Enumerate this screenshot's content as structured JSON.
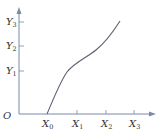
{
  "figure": {
    "origin_label": "O",
    "x_axis": {
      "ticks": [
        {
          "label": "X",
          "sub": "0"
        },
        {
          "label": "X",
          "sub": "1"
        },
        {
          "label": "X",
          "sub": "2"
        },
        {
          "label": "X",
          "sub": "3"
        }
      ]
    },
    "y_axis": {
      "ticks": [
        {
          "label": "Y",
          "sub": "1"
        },
        {
          "label": "Y",
          "sub": "2"
        },
        {
          "label": "Y",
          "sub": "3"
        }
      ]
    },
    "colors": {
      "axis": "#7a8aa8",
      "curve": "#5a6070",
      "text": "#333333"
    }
  }
}
